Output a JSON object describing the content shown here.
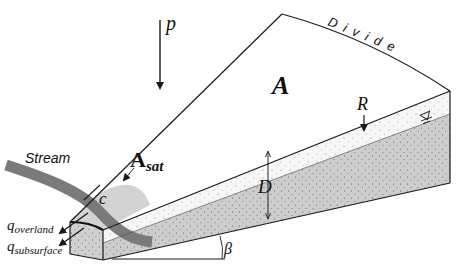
{
  "diagram": {
    "type": "hillslope-wedge-schematic",
    "labels": {
      "precipitation": "p",
      "area": "A",
      "saturated_area_main": "A",
      "saturated_area_sub": "sat",
      "divide": "Divide",
      "recharge": "R",
      "depth": "D",
      "stream": "Stream",
      "contour": "c",
      "q_overland_main": "q",
      "q_overland_sub": "overland",
      "q_subsurface_main": "q",
      "q_subsurface_sub": "subsurface",
      "slope_angle": "β",
      "water_table_symbol": "∇"
    },
    "colors": {
      "line": "#1a1a1a",
      "soil_light": "#f4f4f4",
      "soil_saturated": "#cfcfcf",
      "saturated_area": "#d3d3d3",
      "stream": "#7a7a7a",
      "background": "#ffffff"
    }
  }
}
